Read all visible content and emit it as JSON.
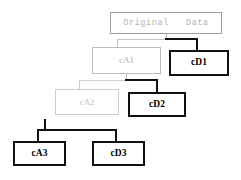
{
  "diagram": {
    "colors": {
      "root_border": "#9d9d9d",
      "root_text": "#b4b4b4",
      "approx1": "#bdbdbd",
      "approx2": "#cccccc",
      "detail_border": "#111111",
      "detail_text": "#000000",
      "background": "#ffffff"
    },
    "nodes": {
      "root": {
        "label": "Original   Data",
        "kind": "original"
      },
      "cA1": {
        "label": "cA1",
        "kind": "approximation",
        "level": 1
      },
      "cD1": {
        "label": "cD1",
        "kind": "detail",
        "level": 1
      },
      "cA2": {
        "label": "cA2",
        "kind": "approximation",
        "level": 2
      },
      "cD2": {
        "label": "cD2",
        "kind": "detail",
        "level": 2
      },
      "cA3": {
        "label": "cA3",
        "kind": "approximation",
        "level": 3
      },
      "cD3": {
        "label": "cD3",
        "kind": "detail",
        "level": 3
      }
    },
    "edges": [
      {
        "from": "root",
        "to": "cA1",
        "style": "grey"
      },
      {
        "from": "root",
        "to": "cD1",
        "style": "dark"
      },
      {
        "from": "cA1",
        "to": "cA2",
        "style": "grey"
      },
      {
        "from": "cA1",
        "to": "cD2",
        "style": "dark"
      },
      {
        "from": "cA2",
        "to": "cA3",
        "style": "dark"
      },
      {
        "from": "cA2",
        "to": "cD3",
        "style": "dark"
      }
    ]
  }
}
